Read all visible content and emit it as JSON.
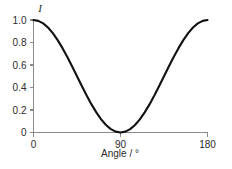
{
  "chart_data": {
    "type": "line",
    "title": "",
    "subtitle": "",
    "xlabel": "Angle / °",
    "ylabel": "I",
    "xlim": [
      0,
      180
    ],
    "ylim": [
      0,
      1.0
    ],
    "grid": false,
    "legend": null,
    "x_ticks": [
      {
        "value": 0,
        "label": "0"
      },
      {
        "value": 90,
        "label": "90"
      },
      {
        "value": 180,
        "label": "180"
      }
    ],
    "y_ticks": [
      {
        "value": 1.0,
        "label": "1.0"
      },
      {
        "value": 0.8,
        "label": "0.8"
      },
      {
        "value": 0.6,
        "label": "0.6"
      },
      {
        "value": 0.4,
        "label": "0.4"
      },
      {
        "value": 0.2,
        "label": "0.2"
      },
      {
        "value": 0.0,
        "label": "0"
      }
    ],
    "series": [
      {
        "name": "I",
        "color": "#111111",
        "x": [
          0,
          5,
          10,
          15,
          20,
          25,
          30,
          35,
          40,
          45,
          50,
          55,
          60,
          65,
          70,
          75,
          80,
          85,
          90,
          95,
          100,
          105,
          110,
          115,
          120,
          125,
          130,
          135,
          140,
          145,
          150,
          155,
          160,
          165,
          170,
          175,
          180
        ],
        "values": [
          1.0,
          0.992,
          0.97,
          0.933,
          0.883,
          0.821,
          0.75,
          0.671,
          0.587,
          0.5,
          0.413,
          0.329,
          0.25,
          0.179,
          0.117,
          0.067,
          0.03,
          0.008,
          0.0,
          0.008,
          0.03,
          0.067,
          0.117,
          0.179,
          0.25,
          0.329,
          0.413,
          0.5,
          0.587,
          0.671,
          0.75,
          0.821,
          0.883,
          0.933,
          0.97,
          0.992,
          1.0
        ]
      }
    ]
  },
  "figure": {
    "background_color": "#ffffff",
    "axis_color": "#8a8a8a",
    "text_color": "#2b2b2b",
    "curve_color": "#111111"
  }
}
